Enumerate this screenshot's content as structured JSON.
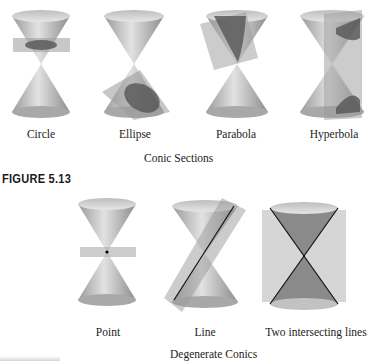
{
  "top_row": {
    "items": [
      {
        "label": "Circle"
      },
      {
        "label": "Ellipse"
      },
      {
        "label": "Parabola"
      },
      {
        "label": "Hyperbola"
      }
    ],
    "caption": "Conic Sections",
    "figure_label": "FIGURE 5.13"
  },
  "bottom_row": {
    "items": [
      {
        "label": "Point"
      },
      {
        "label": "Line"
      },
      {
        "label": "Two intersecting lines"
      }
    ],
    "caption": "Degenerate Conics"
  },
  "colors": {
    "cone": "#c8c8c8",
    "plane": "#a9a9a9",
    "section": "#555555"
  }
}
